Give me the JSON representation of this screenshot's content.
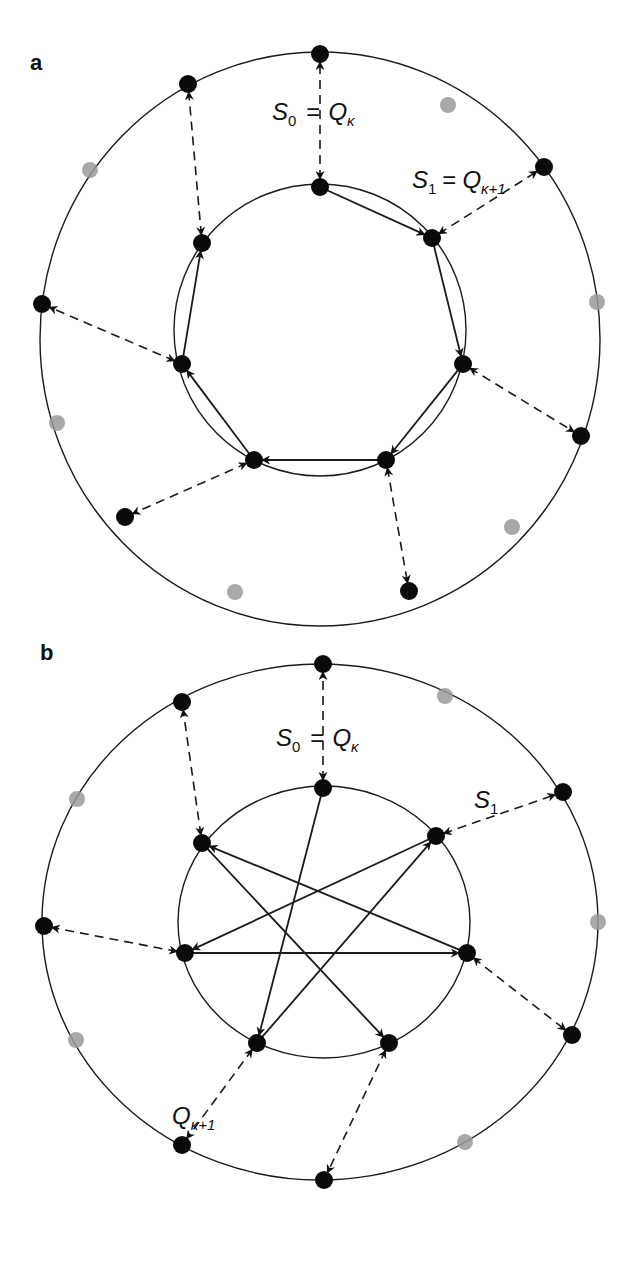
{
  "figure": {
    "panels": [
      {
        "id": "a",
        "label": "a",
        "outer_ring": {
          "cx": 320,
          "cy": 339,
          "rx": 280,
          "ry": 287
        },
        "inner_ring": {
          "cx": 320,
          "cy": 330,
          "rx": 146,
          "ry": 146
        },
        "inner_nodes": [
          {
            "name": "top",
            "x": 320,
            "y": 187
          },
          {
            "name": "upper-right",
            "x": 432,
            "y": 238
          },
          {
            "name": "right",
            "x": 463,
            "y": 364
          },
          {
            "name": "bottom-right",
            "x": 386,
            "y": 460
          },
          {
            "name": "bottom-left",
            "x": 254,
            "y": 460
          },
          {
            "name": "left",
            "x": 182,
            "y": 364
          },
          {
            "name": "upper-left",
            "x": 202,
            "y": 243
          }
        ],
        "outer_nodes": [
          {
            "name": "top",
            "x": 320,
            "y": 54
          },
          {
            "name": "upper-right",
            "x": 544,
            "y": 167
          },
          {
            "name": "right",
            "x": 581,
            "y": 436
          },
          {
            "name": "bottom",
            "x": 409,
            "y": 591
          },
          {
            "name": "lower-left",
            "x": 125,
            "y": 517
          },
          {
            "name": "left",
            "x": 42,
            "y": 304
          },
          {
            "name": "upper-left",
            "x": 188,
            "y": 84
          }
        ],
        "ghost_nodes": [
          {
            "x": 448,
            "y": 105
          },
          {
            "x": 597,
            "y": 302
          },
          {
            "x": 512,
            "y": 527
          },
          {
            "x": 235,
            "y": 592
          },
          {
            "x": 57,
            "y": 423
          },
          {
            "x": 90,
            "y": 170
          }
        ],
        "edges": [
          {
            "from": 0,
            "to": 1
          },
          {
            "from": 1,
            "to": 2
          },
          {
            "from": 2,
            "to": 3
          },
          {
            "from": 3,
            "to": 4
          },
          {
            "from": 4,
            "to": 5
          },
          {
            "from": 5,
            "to": 6
          }
        ],
        "couplings": [
          [
            0,
            0
          ],
          [
            1,
            1
          ],
          [
            2,
            2
          ],
          [
            3,
            3
          ],
          [
            4,
            4
          ],
          [
            5,
            5
          ],
          [
            6,
            6
          ]
        ],
        "labels": {
          "s0": {
            "S": "S",
            "sub": "0",
            "eq": "=",
            "Q": "Q",
            "qsub": "κ",
            "x": 272,
            "y": 120
          },
          "s1": {
            "S": "S",
            "sub": "1",
            "eq": "=",
            "Q": "Q",
            "qsub": "κ+1",
            "x": 412,
            "y": 188
          }
        }
      },
      {
        "id": "b",
        "label": "b",
        "outer_ring": {
          "cx": 320,
          "cy": 922,
          "rx": 278,
          "ry": 258
        },
        "inner_ring": {
          "cx": 324,
          "cy": 922,
          "rx": 146,
          "ry": 136
        },
        "inner_nodes": [
          {
            "name": "top",
            "x": 323,
            "y": 788
          },
          {
            "name": "upper-right",
            "x": 436,
            "y": 836
          },
          {
            "name": "right",
            "x": 467,
            "y": 953
          },
          {
            "name": "bottom-right",
            "x": 389,
            "y": 1043
          },
          {
            "name": "bottom-left",
            "x": 257,
            "y": 1043
          },
          {
            "name": "left",
            "x": 185,
            "y": 953
          },
          {
            "name": "upper-left",
            "x": 202,
            "y": 843
          }
        ],
        "outer_nodes": [
          {
            "name": "top",
            "x": 323,
            "y": 664
          },
          {
            "name": "upper-right",
            "x": 563,
            "y": 792
          },
          {
            "name": "right",
            "x": 572,
            "y": 1035
          },
          {
            "name": "bottom",
            "x": 324,
            "y": 1180
          },
          {
            "name": "lower-left",
            "x": 182,
            "y": 1145
          },
          {
            "name": "left",
            "x": 44,
            "y": 926
          },
          {
            "name": "upper-left",
            "x": 182,
            "y": 702
          }
        ],
        "ghost_nodes": [
          {
            "x": 445,
            "y": 696
          },
          {
            "x": 598,
            "y": 922
          },
          {
            "x": 465,
            "y": 1142
          },
          {
            "x": 76,
            "y": 1040
          },
          {
            "x": 77,
            "y": 799
          }
        ],
        "edges": [
          {
            "from": 0,
            "to": 4
          },
          {
            "from": 4,
            "to": 1
          },
          {
            "from": 1,
            "to": 5
          },
          {
            "from": 5,
            "to": 2
          },
          {
            "from": 2,
            "to": 6
          },
          {
            "from": 6,
            "to": 3
          }
        ],
        "couplings": [
          [
            0,
            0
          ],
          [
            1,
            1
          ],
          [
            2,
            2
          ],
          [
            3,
            3
          ],
          [
            4,
            4
          ],
          [
            5,
            5
          ],
          [
            6,
            6
          ]
        ],
        "labels": {
          "s0": {
            "S": "S",
            "sub": "0",
            "eq": "=",
            "Q": "Q",
            "qsub": "κ",
            "x": 276,
            "y": 746
          },
          "s1": {
            "S": "S",
            "sub": "1",
            "x": 474,
            "y": 808
          },
          "qk1": {
            "Q": "Q",
            "qsub": "κ+1",
            "x": 172,
            "y": 1124
          }
        }
      }
    ]
  }
}
